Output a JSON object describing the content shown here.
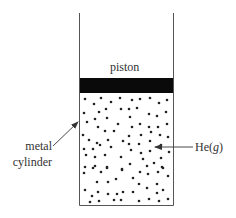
{
  "diagram": {
    "labels": {
      "piston": "piston",
      "cylinder_line1": "metal",
      "cylinder_line2": "cylinder",
      "gas_main": "He(",
      "gas_state": "g",
      "gas_close": ")"
    },
    "colors": {
      "line": "#555555",
      "piston": "#0a0a0a",
      "dots": "#222222",
      "text": "#333333"
    },
    "geometry": {
      "cylinder": {
        "left": 79,
        "right": 173,
        "top": 13,
        "bottom": 205
      },
      "piston": {
        "top": 78,
        "bottom": 93
      },
      "cylinder_arrow": {
        "x1": 53,
        "y1": 146,
        "x2": 78,
        "y2": 122
      },
      "gas_arrow": {
        "x1": 193,
        "y1": 147,
        "x2": 155,
        "y2": 147
      }
    },
    "particles": [
      [
        85,
        99
      ],
      [
        101,
        98
      ],
      [
        111,
        102
      ],
      [
        120,
        98
      ],
      [
        94,
        104
      ],
      [
        106,
        109
      ],
      [
        121,
        109
      ],
      [
        84,
        113
      ],
      [
        99,
        112
      ],
      [
        95,
        119
      ],
      [
        107,
        118
      ],
      [
        87,
        122
      ],
      [
        118,
        124
      ],
      [
        98,
        127
      ],
      [
        105,
        131
      ],
      [
        114,
        131
      ],
      [
        132,
        100
      ],
      [
        140,
        99
      ],
      [
        150,
        98
      ],
      [
        159,
        103
      ],
      [
        167,
        100
      ],
      [
        129,
        109
      ],
      [
        137,
        108
      ],
      [
        149,
        114
      ],
      [
        157,
        116
      ],
      [
        166,
        112
      ],
      [
        130,
        117
      ],
      [
        140,
        124
      ],
      [
        132,
        127
      ],
      [
        149,
        127
      ],
      [
        158,
        127
      ],
      [
        167,
        124
      ],
      [
        151,
        132
      ],
      [
        83,
        135
      ],
      [
        89,
        140
      ],
      [
        97,
        143
      ],
      [
        108,
        140
      ],
      [
        123,
        141
      ],
      [
        84,
        149
      ],
      [
        93,
        149
      ],
      [
        100,
        145
      ],
      [
        111,
        147
      ],
      [
        86,
        155
      ],
      [
        95,
        157
      ],
      [
        105,
        155
      ],
      [
        121,
        157
      ],
      [
        85,
        167
      ],
      [
        95,
        166
      ],
      [
        107,
        167
      ],
      [
        122,
        169
      ],
      [
        129,
        136
      ],
      [
        141,
        135
      ],
      [
        160,
        135
      ],
      [
        168,
        137
      ],
      [
        129,
        144
      ],
      [
        139,
        144
      ],
      [
        150,
        141
      ],
      [
        161,
        145
      ],
      [
        131,
        150
      ],
      [
        141,
        153
      ],
      [
        150,
        151
      ],
      [
        169,
        152
      ],
      [
        143,
        159
      ],
      [
        161,
        158
      ],
      [
        130,
        164
      ],
      [
        147,
        166
      ],
      [
        154,
        163
      ],
      [
        162,
        167
      ],
      [
        84,
        173
      ],
      [
        93,
        168
      ],
      [
        101,
        172
      ],
      [
        107,
        168
      ],
      [
        122,
        170
      ],
      [
        97,
        182
      ],
      [
        108,
        182
      ],
      [
        116,
        179
      ],
      [
        85,
        190
      ],
      [
        98,
        192
      ],
      [
        108,
        194
      ],
      [
        117,
        194
      ],
      [
        123,
        192
      ],
      [
        92,
        196
      ],
      [
        99,
        201
      ],
      [
        114,
        200
      ],
      [
        121,
        200
      ],
      [
        90,
        202
      ],
      [
        140,
        172
      ],
      [
        148,
        174
      ],
      [
        158,
        172
      ],
      [
        163,
        168
      ],
      [
        168,
        176
      ],
      [
        133,
        178
      ],
      [
        139,
        184
      ],
      [
        147,
        188
      ],
      [
        157,
        184
      ],
      [
        133,
        192
      ],
      [
        157,
        193
      ],
      [
        163,
        190
      ],
      [
        139,
        201
      ],
      [
        149,
        199
      ],
      [
        159,
        201
      ],
      [
        168,
        199
      ]
    ]
  }
}
